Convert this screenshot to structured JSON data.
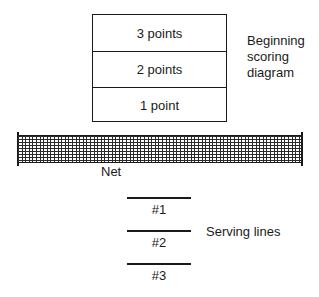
{
  "scoring_diagram": {
    "zones": [
      {
        "label": "3 points"
      },
      {
        "label": "2 points"
      },
      {
        "label": "1 point"
      }
    ],
    "caption_lines": [
      "Beginning",
      "scoring",
      "diagram"
    ]
  },
  "net": {
    "label": "Net"
  },
  "serving": {
    "lines": [
      {
        "label": "#1"
      },
      {
        "label": "#2"
      },
      {
        "label": "#3"
      }
    ],
    "caption": "Serving lines"
  }
}
